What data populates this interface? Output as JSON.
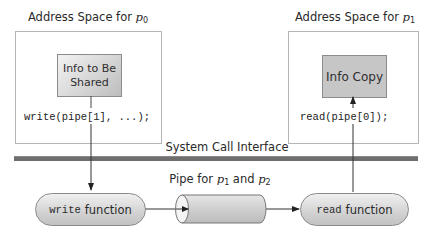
{
  "left_space": {
    "title_prefix": "Address Space for ",
    "title_var": "p",
    "title_sub": "0",
    "info_box_line1": "Info to Be",
    "info_box_line2": "Shared",
    "code": "write(pipe[1], ...);"
  },
  "right_space": {
    "title_prefix": "Address Space for ",
    "title_var": "p",
    "title_sub": "1",
    "info_box": "Info Copy",
    "code": "read(pipe[0]);"
  },
  "system_call_interface": "System Call Interface",
  "kernel": {
    "write_fn": {
      "mono": "write",
      "text": "function"
    },
    "read_fn": {
      "mono": "read",
      "text": "function"
    },
    "pipe_label": {
      "prefix": "Pipe for ",
      "var1": "p",
      "sub1": "1",
      "middle": " and ",
      "var2": "p",
      "sub2": "2"
    }
  },
  "colors": {
    "border": "#b5b5b5",
    "bar": "#6e6e6e",
    "fill_gray": "#c6c6c6",
    "line": "#333333"
  }
}
